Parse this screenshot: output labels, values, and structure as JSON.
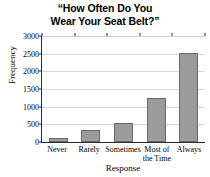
{
  "chart_data": {
    "type": "bar",
    "title": "“How Often Do You Wear Your Seat Belt?”",
    "title_lines": [
      "“How Often Do You",
      "Wear Your Seat Belt?”"
    ],
    "categories": [
      "Never",
      "Rarely",
      "Sometimes",
      "Most of the Time",
      "Always"
    ],
    "category_lines": [
      [
        "Never"
      ],
      [
        "Rarely"
      ],
      [
        "Sometimes"
      ],
      [
        "Most of",
        "the Time"
      ],
      [
        "Always"
      ]
    ],
    "values": [
      100,
      340,
      550,
      1250,
      2510
    ],
    "xlabel": "Response",
    "ylabel": "Frequency",
    "ylim": [
      0,
      3000
    ],
    "yticks": [
      0,
      500,
      1000,
      1500,
      2000,
      2500,
      3000
    ],
    "ytick_labels": [
      "0",
      "500",
      "1000",
      "1500",
      "2000",
      "2500",
      "3000"
    ],
    "grid": "horizontal",
    "legend": "none",
    "bar_color": "#9b9b9b",
    "bar_edge_color": "#6a6a6a",
    "axis_color": "#2b2b2b",
    "grid_color": "#d8d8d8",
    "background": "#ffffff"
  }
}
